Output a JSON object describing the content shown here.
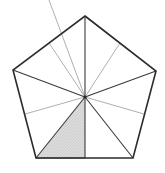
{
  "figure": {
    "title": "Regular pentagon partitioned into ten triangles with one shaded",
    "shape_name": "pentagon",
    "canvas": {
      "width": 165,
      "height": 173,
      "background": "#ffffff"
    },
    "colors": {
      "outline": "#2b2b2b",
      "spoke_vertex": "#3a3a3a",
      "spoke_midpoint": "#9a9a9a",
      "shaded_fill": "#d6d6d6",
      "shaded_stroke": "#555555",
      "hatch": "#bfbfbf"
    },
    "center": {
      "label": "center",
      "x": 85,
      "y": 97
    },
    "vertices": [
      {
        "label": "top",
        "x": 85,
        "y": 16
      },
      {
        "label": "right",
        "x": 156,
        "y": 71
      },
      {
        "label": "bottom-right",
        "x": 133,
        "y": 158
      },
      {
        "label": "bottom-left",
        "x": 36,
        "y": 158
      },
      {
        "label": "left",
        "x": 13,
        "y": 70
      }
    ],
    "edge_midpoints": [
      {
        "label": "upper-right-mid",
        "x": 120,
        "y": 43
      },
      {
        "label": "lower-right-mid",
        "x": 144,
        "y": 114
      },
      {
        "label": "bottom-mid",
        "x": 85,
        "y": 158
      },
      {
        "label": "lower-left-mid",
        "x": 25,
        "y": 114
      },
      {
        "label": "upper-left-mid",
        "x": 49,
        "y": 43
      }
    ],
    "outline_points": "85,16 156,71 133,158 36,158 13,70",
    "spokes_to_vertices": [
      {
        "label": "spoke-to-top",
        "x2": 85,
        "y2": 16
      },
      {
        "label": "spoke-to-right",
        "x2": 156,
        "y2": 71
      },
      {
        "label": "spoke-to-bottom-right",
        "x2": 133,
        "y2": 158
      },
      {
        "label": "spoke-to-bottom-left",
        "x2": 36,
        "y2": 158
      },
      {
        "label": "spoke-to-left",
        "x2": 13,
        "y2": 70
      }
    ],
    "spokes_to_midpoints": [
      {
        "label": "spoke-to-upper-right-mid",
        "x2": 120,
        "y2": 43
      },
      {
        "label": "spoke-to-lower-right-mid",
        "x2": 144,
        "y2": 114
      },
      {
        "label": "spoke-to-bottom-mid",
        "x2": 85,
        "y2": 158
      },
      {
        "label": "spoke-to-lower-left-mid",
        "x2": 25,
        "y2": 114
      },
      {
        "label": "spoke-to-upper-left-mid",
        "x2": 49,
        "y2": 43
      }
    ],
    "shaded_triangle": {
      "label": "shaded-triangle",
      "points": "85,97 36,158 85,158",
      "count_of_total_parts": 10,
      "shaded_parts": 1
    }
  }
}
